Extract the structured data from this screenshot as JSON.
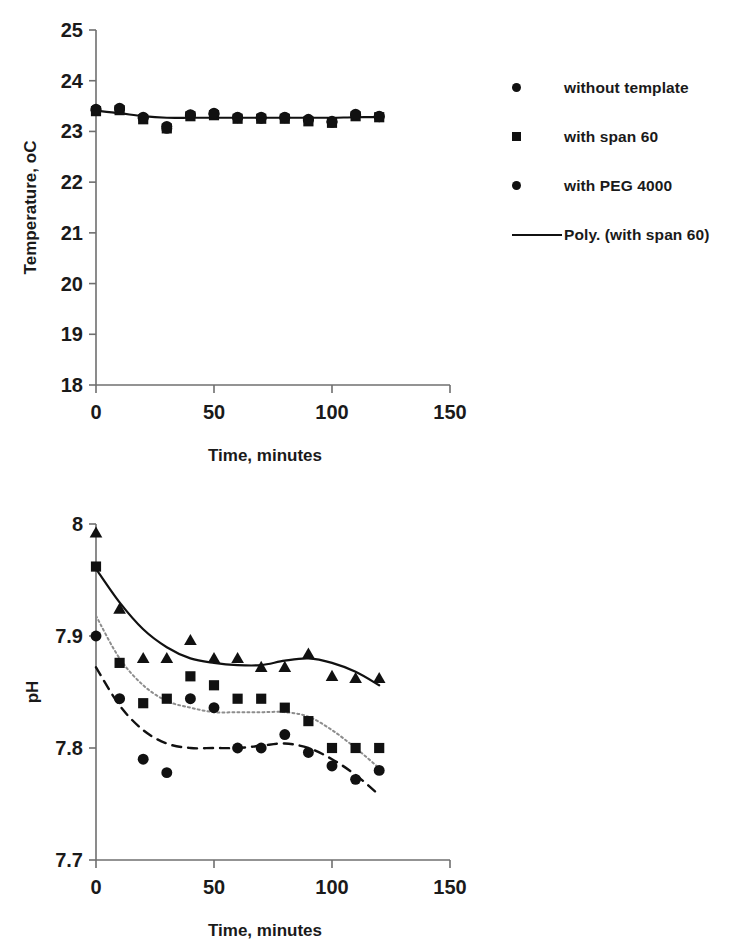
{
  "chart_data": [
    {
      "id": "temperature",
      "type": "scatter",
      "title": "",
      "xlabel": "Time, minutes",
      "ylabel": "Temperature, oC",
      "xlim": [
        0,
        150
      ],
      "ylim": [
        18,
        25
      ],
      "xticks": [
        0,
        50,
        100,
        150
      ],
      "xtick_labels": [
        "0",
        "50",
        "100",
        "150"
      ],
      "yticks": [
        18,
        19,
        20,
        21,
        22,
        23,
        24,
        25
      ],
      "ytick_labels": [
        "18",
        "19",
        "20",
        "21",
        "22",
        "23",
        "24",
        "25"
      ],
      "grid": false,
      "legend_position": "right",
      "x": [
        0,
        10,
        20,
        30,
        40,
        50,
        60,
        70,
        80,
        90,
        100,
        110,
        120
      ],
      "series": [
        {
          "name": "without template",
          "marker": "circle",
          "values": [
            23.42,
            23.44,
            23.26,
            23.06,
            23.32,
            23.34,
            23.27,
            23.26,
            23.27,
            23.22,
            23.18,
            23.32,
            23.29
          ]
        },
        {
          "name": "with span 60",
          "marker": "square",
          "values": [
            23.4,
            23.42,
            23.24,
            23.06,
            23.3,
            23.32,
            23.25,
            23.25,
            23.25,
            23.2,
            23.17,
            23.3,
            23.28
          ]
        },
        {
          "name": "with PEG 4000",
          "marker": "circle",
          "values": [
            23.44,
            23.46,
            23.28,
            23.1,
            23.33,
            23.36,
            23.28,
            23.28,
            23.28,
            23.24,
            23.2,
            23.34,
            23.3
          ]
        },
        {
          "name": "Poly. (with span 60)",
          "marker": "line-solid",
          "fit": true,
          "values": [
            23.41,
            23.36,
            23.3,
            23.27,
            23.27,
            23.27,
            23.27,
            23.27,
            23.27,
            23.27,
            23.27,
            23.28,
            23.28
          ]
        }
      ],
      "legend": [
        {
          "label": "without template",
          "key": "circle"
        },
        {
          "label": "with span 60",
          "key": "square"
        },
        {
          "label": "with PEG 4000",
          "key": "circle"
        },
        {
          "label": "Poly. (with span 60)",
          "key": "line-solid"
        }
      ]
    },
    {
      "id": "ph",
      "type": "scatter",
      "title": "",
      "xlabel": "Time, minutes",
      "ylabel": "pH",
      "xlim": [
        0,
        150
      ],
      "ylim": [
        7.7,
        8.0
      ],
      "xticks": [
        0,
        50,
        100,
        150
      ],
      "xtick_labels": [
        "0",
        "50",
        "100",
        "150"
      ],
      "yticks": [
        7.7,
        7.8,
        7.9,
        8.0
      ],
      "ytick_labels": [
        "7.7",
        "7.8",
        "7.9",
        "8"
      ],
      "grid": false,
      "legend_position": "right",
      "x": [
        0,
        10,
        20,
        30,
        40,
        50,
        60,
        70,
        80,
        90,
        100,
        110,
        120
      ],
      "series": [
        {
          "name": "without template",
          "marker": "circle",
          "values": [
            7.9,
            7.844,
            7.79,
            7.778,
            7.844,
            7.836,
            7.8,
            7.8,
            7.812,
            7.796,
            7.784,
            7.772,
            7.78
          ]
        },
        {
          "name": "with span 60",
          "marker": "square",
          "values": [
            7.962,
            7.876,
            7.84,
            7.844,
            7.864,
            7.856,
            7.844,
            7.844,
            7.836,
            7.824,
            7.8,
            7.8,
            7.8
          ]
        },
        {
          "name": "with PEG 4000",
          "marker": "triangle",
          "values": [
            7.992,
            7.924,
            7.88,
            7.88,
            7.896,
            7.88,
            7.88,
            7.872,
            7.872,
            7.884,
            7.864,
            7.862,
            7.862
          ]
        },
        {
          "name": "Poly. (without template)",
          "marker": "line-dashed",
          "fit": true,
          "values": [
            7.872,
            7.838,
            7.816,
            7.804,
            7.8,
            7.8,
            7.8,
            7.802,
            7.804,
            7.8,
            7.79,
            7.776,
            7.758
          ]
        },
        {
          "name": "Poly. (with span 60)",
          "marker": "line-dotted",
          "fit": true,
          "values": [
            7.918,
            7.88,
            7.856,
            7.842,
            7.836,
            7.832,
            7.832,
            7.832,
            7.832,
            7.828,
            7.816,
            7.8,
            7.782
          ]
        },
        {
          "name": "Poly. (with PEG 4000)",
          "marker": "line-solid",
          "fit": true,
          "values": [
            7.96,
            7.93,
            7.906,
            7.89,
            7.88,
            7.876,
            7.874,
            7.874,
            7.878,
            7.88,
            7.876,
            7.868,
            7.856
          ]
        }
      ],
      "legend": [
        {
          "label": "without template",
          "key": "circle"
        },
        {
          "label": "with span 60",
          "key": "square"
        },
        {
          "label": "with PEG 4000",
          "key": "triangle"
        },
        {
          "label": "Poly. (without\ntemplate)",
          "key": "line-dashed"
        },
        {
          "label": "Poly. (with span 60)",
          "key": "line-dotted"
        },
        {
          "label": "Poly. (with PEG 4000)",
          "key": "line-solid"
        }
      ]
    }
  ],
  "colors": {
    "ink": "#111111",
    "axis": "#6f6f6f",
    "dotted_fit": "#8d8d8d",
    "background": "#ffffff"
  }
}
